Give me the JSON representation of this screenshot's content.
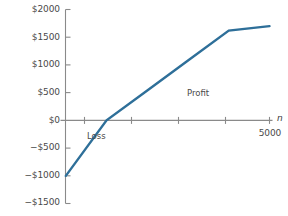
{
  "chart_data": {
    "type": "line",
    "title": "",
    "xlabel": "n",
    "ylabel": "",
    "grid": false,
    "legend": "none",
    "xlim": [
      0,
      5200
    ],
    "ylim": [
      -1500,
      2000
    ],
    "x_ticks": [
      1000,
      2000,
      3000,
      4000,
      5000
    ],
    "x_tick_labels": [
      "",
      "",
      "",
      "",
      "5000"
    ],
    "y_ticks": [
      -1500,
      -1000,
      -500,
      0,
      500,
      1000,
      1500,
      2000
    ],
    "y_tick_labels": [
      "−$1500",
      "−$1000",
      "−$500",
      "$0",
      "$500",
      "$1000",
      "$1500",
      "$2000"
    ],
    "series": [
      {
        "name": "profit-line",
        "color": "#2e6f99",
        "x": [
          0,
          1000,
          2000,
          3000,
          4000,
          5000
        ],
        "values": [
          -1000,
          0,
          540,
          1080,
          1620,
          1700
        ],
        "x_intercept": 1000,
        "y_intercept": -1000
      }
    ],
    "annotations": [
      {
        "text": "Loss",
        "x": 250,
        "y": -300
      },
      {
        "text": "Profit",
        "x": 3450,
        "y": 400
      }
    ]
  },
  "axis_labels": {
    "y": [
      {
        "value": "$2000"
      },
      {
        "value": "$1500"
      },
      {
        "value": "$1000"
      },
      {
        "value": "$500"
      },
      {
        "value": "$0"
      },
      {
        "value": "−$500"
      },
      {
        "value": "−$1000"
      },
      {
        "value": "−$1500"
      }
    ],
    "x": [
      {
        "value": "5000"
      }
    ],
    "x_axis_name": "n"
  },
  "annotations": {
    "loss": "Loss",
    "profit": "Profit"
  },
  "colors": {
    "line": "#2e6f99",
    "axis": "#8a8a8a",
    "text": "#4a4a4a",
    "background": "#ffffff"
  }
}
